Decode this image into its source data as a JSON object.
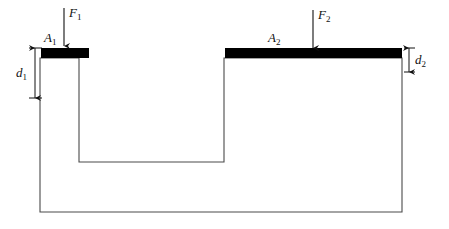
{
  "figure": {
    "kind": "hydraulic-press-cross-section",
    "width": 449,
    "height": 229,
    "background_color": "#ffffff",
    "outline_color": "#4a4a4a",
    "piston_color": "#000000",
    "annotation_color": "#111111"
  },
  "labels": {
    "area_left_base": "A",
    "area_left_sub": "1",
    "area_right_base": "A",
    "area_right_sub": "2",
    "force_left_base": "F",
    "force_left_sub": "1",
    "force_right_base": "F",
    "force_right_sub": "2",
    "depth_left_base": "d",
    "depth_left_sub": "1",
    "depth_right_base": "d",
    "depth_right_sub": "2"
  },
  "geometry": {
    "vessel_left_x": 40,
    "vessel_right_x": 402,
    "vessel_bottom_y": 212,
    "vessel_top_y": 58,
    "notch_left_x": 79,
    "notch_right_x": 224,
    "notch_floor_y": 162,
    "piston_top_y": 48,
    "piston_bottom_y": 58,
    "piston_left_start_x": 41,
    "piston_left_end_x": 89,
    "piston_right_start_x": 225,
    "piston_right_end_x": 402
  },
  "annotations": {
    "force_left_arrow": {
      "x": 64,
      "y_start": 8,
      "y_end": 48,
      "direction": "down"
    },
    "force_right_arrow": {
      "x": 313,
      "y_start": 10,
      "y_end": 50,
      "direction": "down"
    },
    "depth_left_dim": {
      "x": 35,
      "y_top": 48,
      "y_bottom": 98,
      "direction": "both"
    },
    "depth_right_dim": {
      "x": 409,
      "y_top": 48,
      "y_bottom": 72,
      "direction": "both"
    }
  }
}
